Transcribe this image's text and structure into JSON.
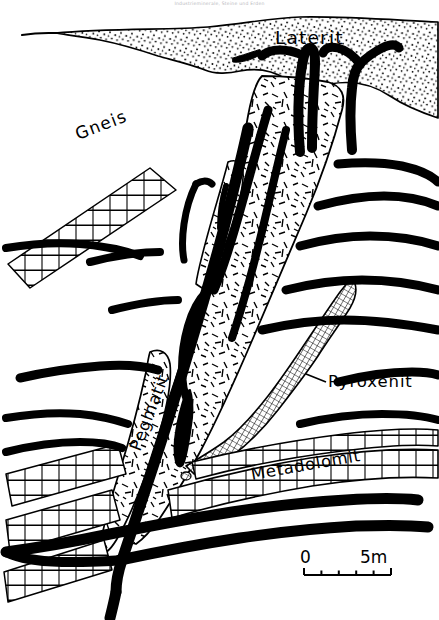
{
  "figure": {
    "header_caption": "Industrieminerale, Steine und Erden",
    "type": "geological-cross-section",
    "background_color": "#ffffff",
    "ink_color": "#000000"
  },
  "labels": {
    "laterite": "Laterit",
    "gneiss": "Gneis",
    "pegmatite": "Pegmatit",
    "pyroxenite": "Pyroxenit",
    "metadolomite": "Metadolomit"
  },
  "scale_bar": {
    "start_label": "0",
    "end_label": "5m",
    "divisions": 5,
    "unit": "m",
    "length_value": 5
  },
  "units": [
    {
      "name": "Laterit",
      "pattern": "stipple-dots",
      "description": "surface laterite cover with fine dot stipple"
    },
    {
      "name": "Gneis",
      "pattern": "blank",
      "description": "unornamented host gneiss"
    },
    {
      "name": "Pegmatit",
      "pattern": "random-dashes",
      "description": "pegmatite body with scattered short dash ornament"
    },
    {
      "name": "Pyroxenit",
      "pattern": "cross-hatch-grid",
      "description": "pyroxenite band with cross-hatched grid ornament"
    },
    {
      "name": "Metadolomit",
      "pattern": "brick-courses",
      "description": "metadolomite bands drawn as brick courses"
    },
    {
      "name": "veins",
      "pattern": "solid-black",
      "description": "solid black ore veins and dykes"
    }
  ]
}
